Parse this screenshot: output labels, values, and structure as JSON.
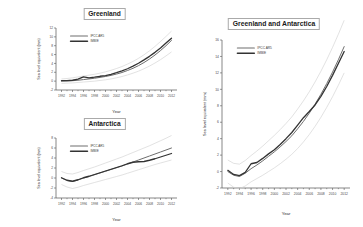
{
  "figure": {
    "background": "#ffffff",
    "series_colors": {
      "ipcc_ar5": "#6e6e6e",
      "imbie": "#333333",
      "uncertainty": "#cfcfcf"
    }
  },
  "chart_data": [
    {
      "type": "line",
      "id": "greenland",
      "title": "Greenland",
      "xlabel": "Year",
      "ylabel": "Sea level equivalent (mm)",
      "xlim": [
        1991,
        2013
      ],
      "ylim": [
        -2,
        12
      ],
      "xticks": [
        1992,
        1994,
        1996,
        1998,
        2000,
        2002,
        2004,
        2006,
        2008,
        2010,
        2012
      ],
      "yticks": [
        -2,
        0,
        2,
        4,
        6,
        8,
        10,
        12
      ],
      "grid": false,
      "legend_position": "upper-left",
      "x": [
        1992,
        1993,
        1994,
        1995,
        1996,
        1997,
        1998,
        1999,
        2000,
        2001,
        2002,
        2003,
        2004,
        2005,
        2006,
        2007,
        2008,
        2009,
        2010,
        2011,
        2012
      ],
      "series": [
        {
          "name": "IPCC AR5",
          "values": [
            0.0,
            0.05,
            0.1,
            0.2,
            0.35,
            0.5,
            0.65,
            0.85,
            1.05,
            1.3,
            1.6,
            1.95,
            2.4,
            2.9,
            3.5,
            4.2,
            5.0,
            5.9,
            6.9,
            8.0,
            9.2
          ],
          "uncertainty_upper": [
            0.5,
            0.6,
            0.75,
            0.95,
            1.15,
            1.35,
            1.55,
            1.8,
            2.1,
            2.45,
            2.85,
            3.3,
            3.85,
            4.45,
            5.15,
            5.95,
            6.85,
            7.85,
            8.95,
            10.1,
            11.3
          ],
          "uncertainty_lower": [
            -0.5,
            -0.45,
            -0.4,
            -0.3,
            -0.2,
            -0.1,
            0.0,
            0.15,
            0.3,
            0.5,
            0.75,
            1.05,
            1.4,
            1.8,
            2.25,
            2.8,
            3.4,
            4.1,
            4.85,
            5.7,
            6.6
          ]
        },
        {
          "name": "IMBIE",
          "values": [
            0.1,
            0.12,
            0.2,
            0.45,
            0.95,
            0.75,
            0.9,
            1.1,
            1.25,
            1.55,
            1.9,
            2.3,
            2.8,
            3.4,
            4.05,
            4.8,
            5.6,
            6.5,
            7.5,
            8.6,
            9.7
          ]
        }
      ]
    },
    {
      "type": "line",
      "id": "antarctica",
      "title": "Antarctica",
      "xlabel": "Year",
      "ylabel": "Sea level equivalent (mm)",
      "xlim": [
        1991,
        2013
      ],
      "ylim": [
        -4,
        8
      ],
      "xticks": [
        1992,
        1994,
        1996,
        1998,
        2000,
        2002,
        2004,
        2006,
        2008,
        2010,
        2012
      ],
      "yticks": [
        -4,
        -2,
        0,
        2,
        4,
        6,
        8
      ],
      "grid": false,
      "legend_position": "upper-left",
      "x": [
        1992,
        1993,
        1994,
        1995,
        1996,
        1997,
        1998,
        1999,
        2000,
        2001,
        2002,
        2003,
        2004,
        2005,
        2006,
        2007,
        2008,
        2009,
        2010,
        2011,
        2012
      ],
      "series": [
        {
          "name": "IPCC AR5",
          "values": [
            0.0,
            -0.5,
            -0.7,
            -0.4,
            0.0,
            0.3,
            0.65,
            1.0,
            1.35,
            1.7,
            2.05,
            2.4,
            2.8,
            3.2,
            3.6,
            4.0,
            4.4,
            4.8,
            5.2,
            5.6,
            6.0
          ],
          "uncertainty_upper": [
            1.3,
            0.9,
            0.8,
            1.1,
            1.5,
            1.85,
            2.2,
            2.6,
            3.0,
            3.4,
            3.8,
            4.2,
            4.65,
            5.1,
            5.55,
            6.0,
            6.45,
            6.95,
            7.45,
            7.95,
            8.5
          ],
          "uncertainty_lower": [
            -1.3,
            -1.8,
            -2.1,
            -1.85,
            -1.5,
            -1.2,
            -0.9,
            -0.6,
            -0.3,
            0.0,
            0.3,
            0.6,
            0.95,
            1.3,
            1.65,
            2.0,
            2.35,
            2.7,
            3.0,
            3.3,
            3.6
          ]
        },
        {
          "name": "IMBIE",
          "values": [
            0.05,
            -0.45,
            -0.65,
            -0.35,
            0.05,
            0.35,
            0.7,
            1.05,
            1.4,
            1.75,
            2.1,
            2.45,
            2.85,
            3.15,
            3.25,
            3.3,
            3.55,
            3.85,
            4.2,
            4.55,
            4.9
          ]
        }
      ]
    },
    {
      "type": "line",
      "id": "greenland-and-antarctica",
      "title": "Greenland and Antarctica",
      "xlabel": "Year",
      "ylabel": "Sea level equivalent (mm)",
      "xlim": [
        1991,
        2013
      ],
      "ylim": [
        -2,
        16
      ],
      "xticks": [
        1992,
        1994,
        1996,
        1998,
        2000,
        2002,
        2004,
        2006,
        2008,
        2010,
        2012
      ],
      "yticks": [
        -2,
        0,
        2,
        4,
        6,
        8,
        10,
        12,
        14,
        16
      ],
      "grid": false,
      "legend_position": "upper-left",
      "x": [
        1992,
        1993,
        1994,
        1995,
        1996,
        1997,
        1998,
        1999,
        2000,
        2001,
        2002,
        2003,
        2004,
        2005,
        2006,
        2007,
        2008,
        2009,
        2010,
        2011,
        2012
      ],
      "series": [
        {
          "name": "IPCC AR5",
          "values": [
            0.0,
            -0.45,
            -0.6,
            -0.2,
            0.35,
            0.8,
            1.3,
            1.85,
            2.4,
            3.0,
            3.65,
            4.35,
            5.2,
            6.1,
            7.1,
            8.2,
            9.4,
            10.7,
            12.1,
            13.6,
            15.2
          ],
          "uncertainty_upper": [
            1.4,
            1.0,
            0.9,
            1.35,
            1.95,
            2.5,
            3.1,
            3.75,
            4.4,
            5.1,
            5.85,
            6.65,
            7.6,
            8.6,
            9.7,
            10.9,
            12.2,
            13.6,
            15.1,
            16.7,
            18.4
          ],
          "uncertainty_lower": [
            -1.4,
            -1.9,
            -2.1,
            -1.75,
            -1.25,
            -0.85,
            -0.45,
            0.0,
            0.45,
            0.95,
            1.5,
            2.1,
            2.8,
            3.6,
            4.5,
            5.5,
            6.6,
            7.8,
            9.1,
            10.5,
            12.0
          ]
        },
        {
          "name": "IMBIE",
          "values": [
            0.15,
            -0.35,
            -0.5,
            -0.1,
            0.95,
            1.1,
            1.6,
            2.15,
            2.65,
            3.3,
            4.0,
            4.75,
            5.65,
            6.55,
            7.3,
            8.1,
            9.15,
            10.35,
            11.7,
            13.15,
            14.6
          ]
        }
      ]
    }
  ]
}
